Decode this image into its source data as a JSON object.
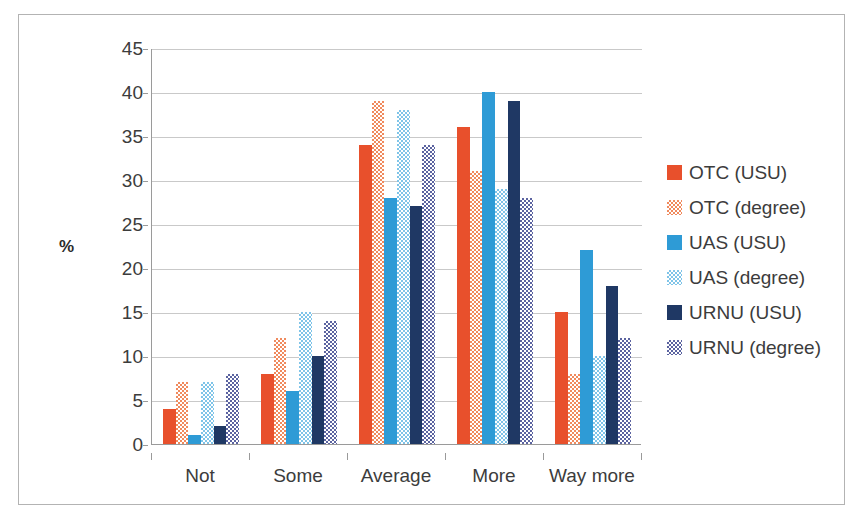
{
  "chart_data": {
    "type": "bar",
    "title": "",
    "xlabel": "",
    "ylabel": "%",
    "ylim": [
      0,
      45
    ],
    "ytick_step": 5,
    "yticks": [
      45,
      40,
      35,
      30,
      25,
      20,
      15,
      10,
      5,
      0
    ],
    "grid": true,
    "legend_position": "right",
    "categories": [
      "Not",
      "Some",
      "Average",
      "More",
      "Way more"
    ],
    "series": [
      {
        "name": "OTC (USU)",
        "color": "#E8502C",
        "pattern": "solid",
        "values": [
          4,
          8,
          34,
          36,
          15
        ]
      },
      {
        "name": "OTC (degree)",
        "color": "#F08A5D",
        "pattern": "checkered",
        "values": [
          7,
          12,
          39,
          31,
          8
        ]
      },
      {
        "name": "UAS (USU)",
        "color": "#2E9BD6",
        "pattern": "solid",
        "values": [
          1,
          6,
          28,
          40,
          22
        ]
      },
      {
        "name": "UAS (degree)",
        "color": "#7FC4E8",
        "pattern": "checkered",
        "values": [
          7,
          15,
          38,
          29,
          10
        ]
      },
      {
        "name": "URNU (USU)",
        "color": "#1F3864",
        "pattern": "solid",
        "values": [
          2,
          10,
          27,
          39,
          18
        ]
      },
      {
        "name": "URNU (degree)",
        "color": "#5B63A0",
        "pattern": "checkered",
        "values": [
          8,
          14,
          34,
          28,
          12
        ]
      }
    ]
  },
  "axis": {
    "y_title": "%",
    "y_tick_labels": [
      "45",
      "40",
      "35",
      "30",
      "25",
      "20",
      "15",
      "10",
      "5",
      "0"
    ],
    "x_tick_labels": [
      "Not",
      "Some",
      "Average",
      "More",
      "Way more"
    ]
  },
  "legend": {
    "items": [
      {
        "label": "OTC (USU)"
      },
      {
        "label": "OTC (degree)"
      },
      {
        "label": "UAS (USU)"
      },
      {
        "label": "UAS (degree)"
      },
      {
        "label": "URNU (USU)"
      },
      {
        "label": "URNU (degree)"
      }
    ]
  }
}
